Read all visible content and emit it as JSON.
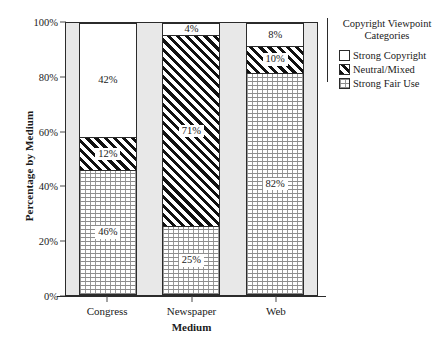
{
  "chart_data": {
    "type": "bar",
    "subtype": "100% stacked bar",
    "title": "",
    "xlabel": "Medium",
    "ylabel": "Percentage by Medium",
    "categories": [
      "Congress",
      "Newspaper",
      "Web"
    ],
    "series": [
      {
        "name": "Strong Copyright",
        "pattern": "solid-white",
        "values": [
          42,
          4,
          8
        ],
        "labels": [
          "42%",
          "4%",
          "8%"
        ]
      },
      {
        "name": "Neutral/Mixed",
        "pattern": "diagonal-hatch-black",
        "values": [
          12,
          71,
          10
        ],
        "labels": [
          "12%",
          "71%",
          "10%"
        ]
      },
      {
        "name": "Strong Fair Use",
        "pattern": "fine-dotted",
        "values": [
          46,
          25,
          82
        ],
        "labels": [
          "46%",
          "25%",
          "82%"
        ]
      }
    ],
    "stack_order_top_to_bottom": [
      "Strong Copyright",
      "Neutral/Mixed",
      "Strong Fair Use"
    ],
    "ylim": [
      0,
      100
    ],
    "yticks": [
      0,
      20,
      40,
      60,
      80,
      100
    ],
    "ytick_labels": [
      "0%",
      "20%",
      "40%",
      "60%",
      "80%",
      "100%"
    ],
    "grid": false,
    "legend_position": "right",
    "legend_title": "Copyright Viewpoint Categories",
    "plot_background": "#e8e8e8",
    "figure_background": "#ffffff",
    "axis_color": "#2b2b2b"
  },
  "axes": {
    "y_title": "Percentage by Medium",
    "x_title": "Medium",
    "y_ticks": [
      {
        "label": "100%",
        "value": 100
      },
      {
        "label": "80%",
        "value": 80
      },
      {
        "label": "60%",
        "value": 60
      },
      {
        "label": "40%",
        "value": 40
      },
      {
        "label": "20%",
        "value": 20
      },
      {
        "label": "0%",
        "value": 0
      }
    ],
    "x_ticks": [
      {
        "label": "Congress"
      },
      {
        "label": "Newspaper"
      },
      {
        "label": "Web"
      }
    ]
  },
  "bars": [
    {
      "category": "Congress",
      "segments": [
        {
          "series": "Strong Copyright",
          "value": 42,
          "label": "42%",
          "pattern": "pat-copyright",
          "boxed_label": false
        },
        {
          "series": "Neutral/Mixed",
          "value": 12,
          "label": "12%",
          "pattern": "pat-neutral",
          "boxed_label": true
        },
        {
          "series": "Strong Fair Use",
          "value": 46,
          "label": "46%",
          "pattern": "pat-fairuse",
          "boxed_label": true
        }
      ]
    },
    {
      "category": "Newspaper",
      "segments": [
        {
          "series": "Strong Copyright",
          "value": 4,
          "label": "4%",
          "pattern": "pat-copyright",
          "boxed_label": false
        },
        {
          "series": "Neutral/Mixed",
          "value": 71,
          "label": "71%",
          "pattern": "pat-neutral",
          "boxed_label": true
        },
        {
          "series": "Strong Fair Use",
          "value": 25,
          "label": "25%",
          "pattern": "pat-fairuse",
          "boxed_label": true
        }
      ]
    },
    {
      "category": "Web",
      "segments": [
        {
          "series": "Strong Copyright",
          "value": 8,
          "label": "8%",
          "pattern": "pat-copyright",
          "boxed_label": false
        },
        {
          "series": "Neutral/Mixed",
          "value": 10,
          "label": "10%",
          "pattern": "pat-neutral",
          "boxed_label": true
        },
        {
          "series": "Strong Fair Use",
          "value": 82,
          "label": "82%",
          "pattern": "pat-fairuse",
          "boxed_label": true
        }
      ]
    }
  ],
  "legend": {
    "title_line1": "Copyright Viewpoint",
    "title_line2": "Categories",
    "items": [
      {
        "label": "Strong Copyright",
        "pattern": "pat-copyright"
      },
      {
        "label": "Neutral/Mixed",
        "pattern": "pat-neutral"
      },
      {
        "label": "Strong Fair Use",
        "pattern": "pat-fairuse"
      }
    ]
  }
}
